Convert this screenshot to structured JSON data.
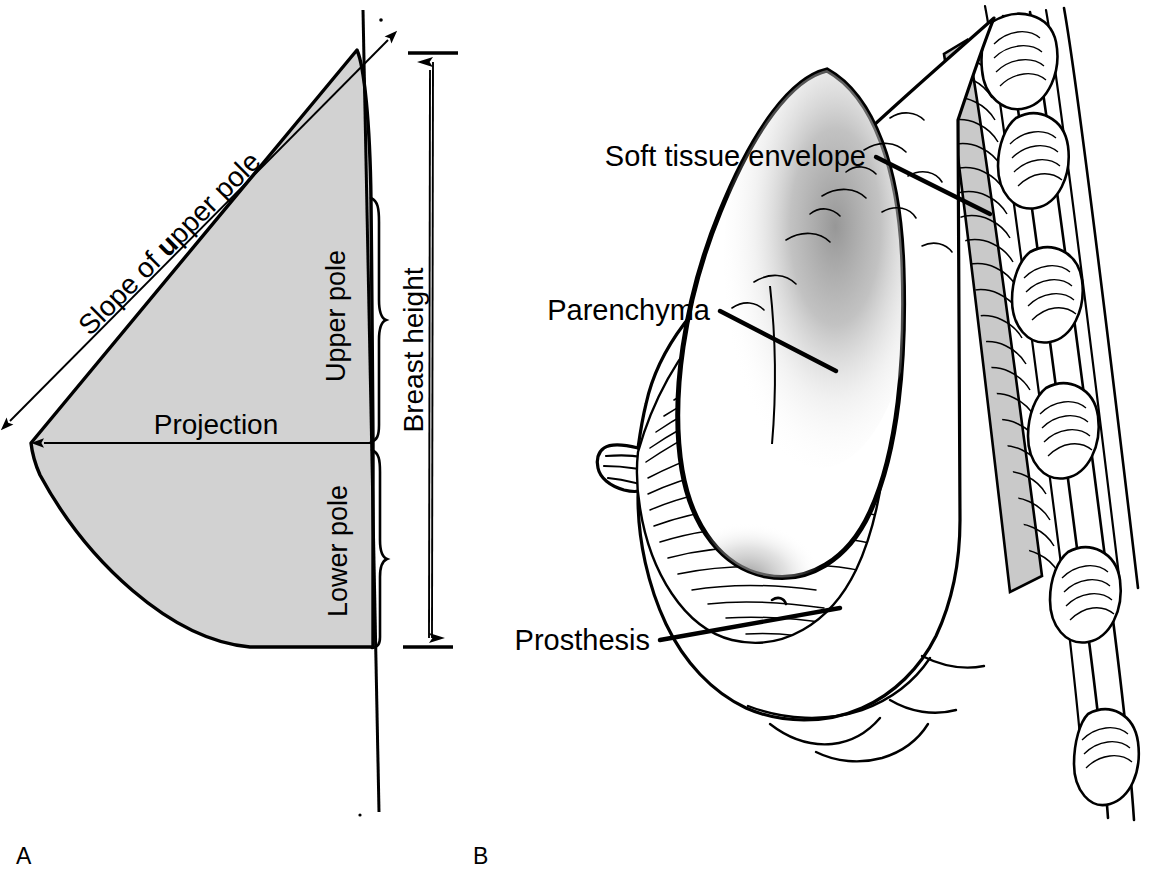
{
  "figure": {
    "background": "#ffffff",
    "ink_color": "#000000",
    "shade_fill": "#d2d2d2",
    "muscle_fill": "#c9c9c9",
    "width": 1153,
    "height": 890
  },
  "panel_a": {
    "letter": "A",
    "caption": "Schematic lateral profile of the breast showing aesthetic measurements",
    "labels": {
      "slope": "Slope of upper pole",
      "slope_emphasis": "u",
      "projection": "Projection",
      "upper_pole": "Upper pole",
      "lower_pole": "Lower pole",
      "breast_height": "Breast height"
    },
    "measures": [
      {
        "name": "Slope of upper pole",
        "kind": "double-arrow",
        "orientation": "diagonal"
      },
      {
        "name": "Projection",
        "kind": "single-arrow",
        "orientation": "horizontal"
      },
      {
        "name": "Breast height",
        "kind": "double-arrow-capped",
        "orientation": "vertical"
      },
      {
        "name": "Upper pole",
        "kind": "brace",
        "orientation": "vertical"
      },
      {
        "name": "Lower pole",
        "kind": "brace",
        "orientation": "vertical"
      }
    ]
  },
  "panel_b": {
    "letter": "B",
    "caption": "Sagittal section of an augmented breast",
    "labels": {
      "soft_tissue": "Soft tissue envelope",
      "parenchyma": "Parenchyma",
      "prosthesis": "Prosthesis"
    },
    "structures": [
      "soft tissue envelope",
      "parenchyma",
      "prosthesis",
      "pectoralis muscle",
      "ribs",
      "intercostal muscle",
      "nipple"
    ]
  }
}
